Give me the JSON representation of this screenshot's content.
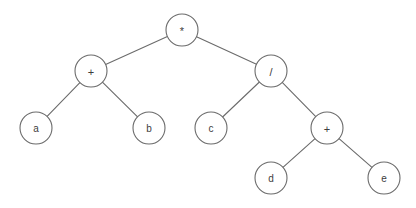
{
  "diagram": {
    "type": "binary-expression-tree",
    "expression": "(a + b) * (c / (d + e))",
    "background_color": "#ffffff",
    "node_fill_color": "#ffffff",
    "node_stroke_color": "#6b6b6b",
    "edge_color": "#6b6b6b",
    "label_color": "#3d3d3d",
    "node_radius": 16,
    "canvas": {
      "width": 416,
      "height": 208
    }
  },
  "nodes": [
    {
      "id": "n0",
      "label": "*",
      "kind": "operator",
      "x": 182,
      "y": 30
    },
    {
      "id": "n1",
      "label": "+",
      "kind": "operator",
      "x": 91,
      "y": 71
    },
    {
      "id": "n2",
      "label": "/",
      "kind": "operator",
      "x": 271,
      "y": 71
    },
    {
      "id": "n3",
      "label": "a",
      "kind": "operand",
      "x": 36,
      "y": 128
    },
    {
      "id": "n4",
      "label": "b",
      "kind": "operand",
      "x": 149,
      "y": 128
    },
    {
      "id": "n5",
      "label": "c",
      "kind": "operand",
      "x": 211,
      "y": 128
    },
    {
      "id": "n6",
      "label": "+",
      "kind": "operator",
      "x": 327,
      "y": 128
    },
    {
      "id": "n7",
      "label": "d",
      "kind": "operand",
      "x": 271,
      "y": 178
    },
    {
      "id": "n8",
      "label": "e",
      "kind": "operand",
      "x": 384,
      "y": 178
    }
  ],
  "edges": [
    {
      "id": "e0",
      "from": "n0",
      "to": "n1"
    },
    {
      "id": "e1",
      "from": "n0",
      "to": "n2"
    },
    {
      "id": "e2",
      "from": "n1",
      "to": "n3"
    },
    {
      "id": "e3",
      "from": "n1",
      "to": "n4"
    },
    {
      "id": "e4",
      "from": "n2",
      "to": "n5"
    },
    {
      "id": "e5",
      "from": "n2",
      "to": "n6"
    },
    {
      "id": "e6",
      "from": "n6",
      "to": "n7"
    },
    {
      "id": "e7",
      "from": "n6",
      "to": "n8"
    }
  ]
}
